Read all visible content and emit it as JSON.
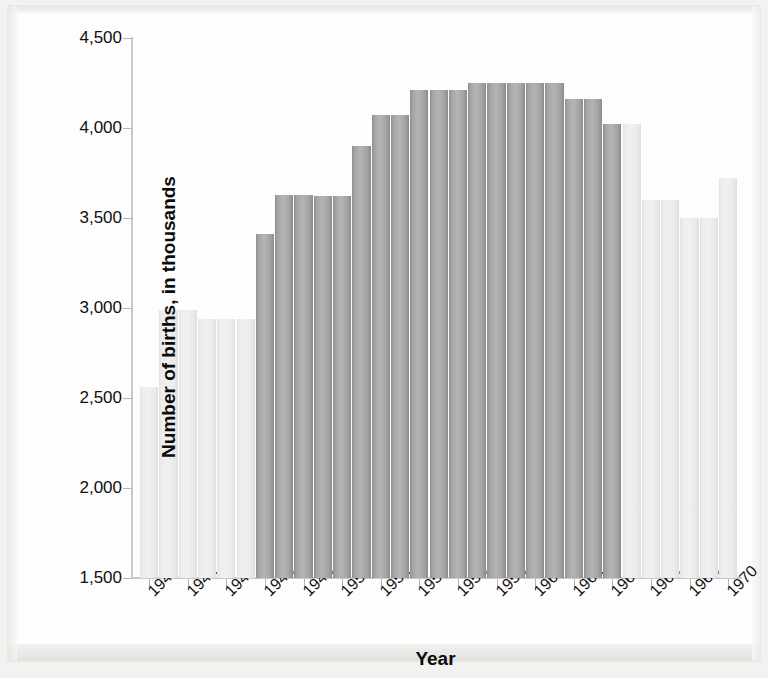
{
  "chart_data": {
    "type": "bar",
    "title": "",
    "xlabel": "Year",
    "ylabel": "Number of births, in thousands",
    "ylim": [
      1500,
      4500
    ],
    "ytick_labels": [
      "4,500",
      "4,000",
      "3,500",
      "3,000",
      "2,500",
      "2,000",
      "1,500"
    ],
    "ytick_values": [
      4500,
      4000,
      3500,
      3000,
      2500,
      2000,
      1500
    ],
    "xtick_labels": [
      "1940",
      "1942",
      "1944",
      "1946",
      "1948",
      "1950",
      "1952",
      "1954",
      "1956",
      "1958",
      "1960",
      "1962",
      "1964",
      "1966",
      "1968",
      "1970"
    ],
    "xtick_values": [
      1940,
      1942,
      1944,
      1946,
      1948,
      1950,
      1952,
      1954,
      1956,
      1958,
      1960,
      1962,
      1964,
      1966,
      1968,
      1970
    ],
    "grid": false,
    "legend": "none",
    "categories": [
      1940,
      1941,
      1942,
      1943,
      1944,
      1945,
      1946,
      1947,
      1948,
      1949,
      1950,
      1951,
      1952,
      1953,
      1954,
      1955,
      1956,
      1957,
      1958,
      1959,
      1960,
      1961,
      1962,
      1963,
      1964,
      1965,
      1966,
      1967,
      1968,
      1969,
      1970
    ],
    "values": [
      2560,
      2700,
      2990,
      2990,
      2940,
      2940,
      3410,
      3630,
      3630,
      3620,
      3620,
      3900,
      4070,
      4070,
      4210,
      4210,
      4210,
      4250,
      4250,
      4250,
      4250,
      4250,
      4160,
      4160,
      4020,
      4020,
      3600,
      3600,
      3500,
      3500,
      3720
    ],
    "series_highlight": {
      "name": "Baby boom cohort (1946-1964)",
      "years": [
        1946,
        1964
      ],
      "color": "#a6a6a6"
    },
    "series_normal": {
      "name": "Other years",
      "color": "#ececec"
    }
  },
  "bars": [
    {
      "year": 1940,
      "value": 2560,
      "highlight": false
    },
    {
      "year": 1941,
      "value": 2990,
      "highlight": false
    },
    {
      "year": 1942,
      "value": 2990,
      "highlight": false
    },
    {
      "year": 1943,
      "value": 2940,
      "highlight": false
    },
    {
      "year": 1944,
      "value": 2940,
      "highlight": false
    },
    {
      "year": 1945,
      "value": 2940,
      "highlight": false
    },
    {
      "year": 1946,
      "value": 3410,
      "highlight": true
    },
    {
      "year": 1947,
      "value": 3630,
      "highlight": true
    },
    {
      "year": 1948,
      "value": 3630,
      "highlight": true
    },
    {
      "year": 1949,
      "value": 3620,
      "highlight": true
    },
    {
      "year": 1950,
      "value": 3620,
      "highlight": true
    },
    {
      "year": 1951,
      "value": 3900,
      "highlight": true
    },
    {
      "year": 1952,
      "value": 4070,
      "highlight": true
    },
    {
      "year": 1953,
      "value": 4070,
      "highlight": true
    },
    {
      "year": 1954,
      "value": 4210,
      "highlight": true
    },
    {
      "year": 1955,
      "value": 4210,
      "highlight": true
    },
    {
      "year": 1956,
      "value": 4210,
      "highlight": true
    },
    {
      "year": 1957,
      "value": 4250,
      "highlight": true
    },
    {
      "year": 1958,
      "value": 4250,
      "highlight": true
    },
    {
      "year": 1959,
      "value": 4250,
      "highlight": true
    },
    {
      "year": 1960,
      "value": 4250,
      "highlight": true
    },
    {
      "year": 1961,
      "value": 4250,
      "highlight": true
    },
    {
      "year": 1962,
      "value": 4160,
      "highlight": true
    },
    {
      "year": 1963,
      "value": 4160,
      "highlight": true
    },
    {
      "year": 1964,
      "value": 4020,
      "highlight": true
    },
    {
      "year": 1965,
      "value": 4020,
      "highlight": false
    },
    {
      "year": 1966,
      "value": 3600,
      "highlight": false
    },
    {
      "year": 1967,
      "value": 3600,
      "highlight": false
    },
    {
      "year": 1968,
      "value": 3500,
      "highlight": false
    },
    {
      "year": 1969,
      "value": 3500,
      "highlight": false
    },
    {
      "year": 1970,
      "value": 3720,
      "highlight": false
    }
  ]
}
